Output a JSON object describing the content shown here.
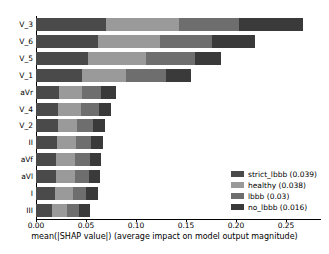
{
  "chart_data": {
    "type": "bar",
    "orientation": "horizontal",
    "stacked": true,
    "title": "",
    "xlabel": "mean(|SHAP value|) (average impact on model output magnitude)",
    "ylabel": "",
    "xlim": [
      0.0,
      0.285
    ],
    "ylim": [
      0,
      12
    ],
    "grid": false,
    "legend_position": "lower right",
    "xticks": [
      0.0,
      0.05,
      0.1,
      0.15,
      0.2,
      0.25
    ],
    "xticklabels": [
      "0.00",
      "0.05",
      "0.10",
      "0.15",
      "0.20",
      "0.25"
    ],
    "categories": [
      "V_3",
      "V_6",
      "V_5",
      "V_1",
      "aVr",
      "V_4",
      "V_2",
      "II",
      "aVf",
      "aVl",
      "I",
      "III"
    ],
    "series": [
      {
        "name": "strict_lbbb",
        "legend_label": "strict_lbbb (0.039)",
        "mean_value": 0.039,
        "color": "#4a4a4a",
        "values": [
          0.07,
          0.062,
          0.052,
          0.046,
          0.023,
          0.022,
          0.022,
          0.021,
          0.02,
          0.02,
          0.019,
          0.016
        ]
      },
      {
        "name": "healthy",
        "legend_label": "healthy (0.038)",
        "mean_value": 0.038,
        "color": "#9a9a9a",
        "values": [
          0.073,
          0.062,
          0.058,
          0.044,
          0.023,
          0.023,
          0.019,
          0.019,
          0.019,
          0.019,
          0.018,
          0.015
        ]
      },
      {
        "name": "lbbb",
        "legend_label": "lbbb (0.03)",
        "mean_value": 0.03,
        "color": "#6e6e6e",
        "values": [
          0.06,
          0.052,
          0.049,
          0.04,
          0.019,
          0.018,
          0.016,
          0.015,
          0.015,
          0.014,
          0.013,
          0.012
        ]
      },
      {
        "name": "no_lbbb",
        "legend_label": "no_lbbb (0.016)",
        "mean_value": 0.016,
        "color": "#3a3a3a",
        "values": [
          0.064,
          0.043,
          0.026,
          0.025,
          0.015,
          0.012,
          0.012,
          0.012,
          0.011,
          0.011,
          0.012,
          0.011
        ]
      }
    ],
    "totals": [
      0.267,
      0.219,
      0.185,
      0.155,
      0.08,
      0.075,
      0.069,
      0.067,
      0.065,
      0.064,
      0.062,
      0.054
    ]
  },
  "legend": {
    "items": [
      {
        "label": "strict_lbbb (0.039)",
        "color": "#4a4a4a"
      },
      {
        "label": "healthy (0.038)",
        "color": "#9a9a9a"
      },
      {
        "label": "lbbb (0.03)",
        "color": "#6e6e6e"
      },
      {
        "label": "no_lbbb (0.016)",
        "color": "#3a3a3a"
      }
    ]
  }
}
